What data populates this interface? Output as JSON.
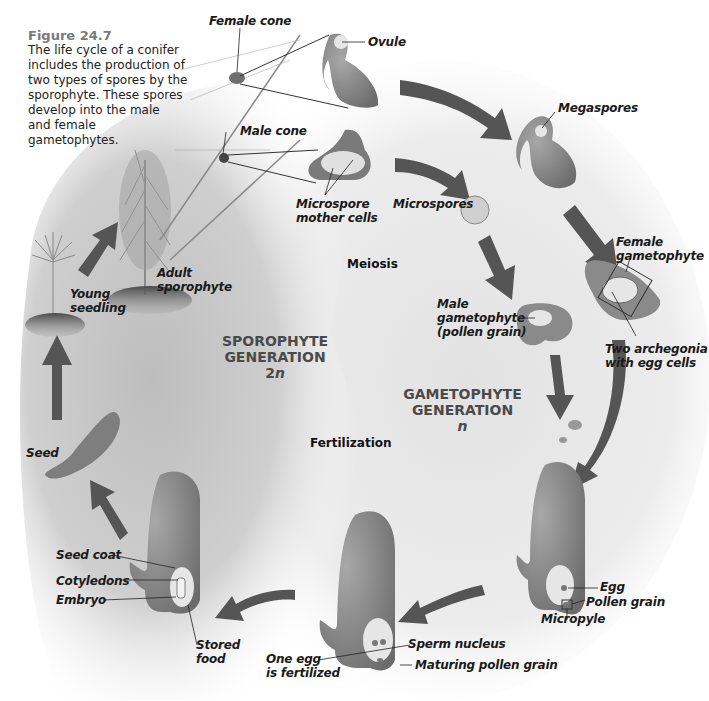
{
  "figure": {
    "number": "Figure 24.7",
    "caption_lines": [
      "The life cycle of a conifer",
      "includes the production of",
      "two types of spores by the",
      "sporophyte. These spores",
      "develop into the male",
      "and female",
      "gametophytes."
    ]
  },
  "generations": {
    "sporophyte": {
      "line1": "SPOROPHYTE",
      "line2": "GENERATION",
      "ploidy": "2n"
    },
    "gametophyte": {
      "line1": "GAMETOPHYTE",
      "line2": "GENERATION",
      "ploidy": "n"
    }
  },
  "processes": {
    "meiosis": "Meiosis",
    "fertilization": "Fertilization"
  },
  "labels": {
    "female_cone": "Female cone",
    "ovule": "Ovule",
    "male_cone": "Male cone",
    "microspore_mother_cells_1": "Microspore",
    "microspore_mother_cells_2": "mother cells",
    "microspores": "Microspores",
    "megaspores": "Megaspores",
    "female_gametophyte_1": "Female",
    "female_gametophyte_2": "gametophyte",
    "two_archegonia_1": "Two archegonia",
    "two_archegonia_2": "with egg cells",
    "male_gametophyte_1": "Male",
    "male_gametophyte_2": "gametophyte",
    "male_gametophyte_3": "(pollen grain)",
    "adult_sporophyte_1": "Adult",
    "adult_sporophyte_2": "sporophyte",
    "young_seedling_1": "Young",
    "young_seedling_2": "seedling",
    "seed": "Seed",
    "egg": "Egg",
    "pollen_grain": "Pollen grain",
    "micropyle": "Micropyle",
    "sperm_nucleus": "Sperm nucleus",
    "one_egg_1": "One egg",
    "one_egg_2": "is fertilized",
    "maturing_pollen_grain": "Maturing pollen grain",
    "seed_coat": "Seed coat",
    "cotyledons": "Cotyledons",
    "embryo": "Embryo",
    "stored_food_1": "Stored",
    "stored_food_2": "food"
  },
  "colors": {
    "arrow": "#555555",
    "structure": "#8a8a8a",
    "structure_dark": "#6e6e6e",
    "inner": "#e6e6e6",
    "sporophyte_bg": "#c9c9c9",
    "gametophyte_bg": "#e4e4e4",
    "plant": "#888888",
    "soil": "#5a5a5a"
  }
}
